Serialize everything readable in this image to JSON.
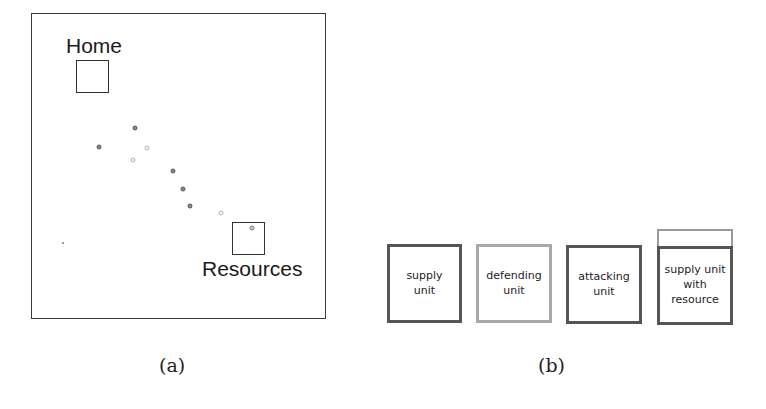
{
  "panel_a": {
    "home_label": "Home",
    "resources_label": "Resources",
    "caption": "(a)",
    "units": [
      {
        "x": 135,
        "y": 128,
        "shade": "dark"
      },
      {
        "x": 99,
        "y": 147,
        "shade": "dark"
      },
      {
        "x": 147,
        "y": 148,
        "shade": "light"
      },
      {
        "x": 133,
        "y": 160,
        "shade": "light"
      },
      {
        "x": 173,
        "y": 171,
        "shade": "dark"
      },
      {
        "x": 183,
        "y": 189,
        "shade": "dark"
      },
      {
        "x": 190,
        "y": 206,
        "shade": "dark"
      },
      {
        "x": 221,
        "y": 213,
        "shade": "light"
      },
      {
        "x": 252,
        "y": 228,
        "shade": "medium"
      }
    ]
  },
  "panel_b": {
    "caption": "(b)",
    "legend": [
      {
        "label_lines": [
          "supply",
          "unit"
        ],
        "border": "dark"
      },
      {
        "label_lines": [
          "defending",
          "unit"
        ],
        "border": "light"
      },
      {
        "label_lines": [
          "attacking",
          "unit"
        ],
        "border": "dark"
      },
      {
        "label_lines": [
          "supply unit",
          "with",
          "resource"
        ],
        "border": "dark",
        "resource_bar": true
      }
    ],
    "labels": {
      "supply": "supply\nunit",
      "defending": "defending\nunit",
      "attacking": "attacking\nunit",
      "supply_with_resource": "supply unit\nwith\nresource"
    }
  },
  "colors": {
    "frame": "#3a3a3a",
    "dark_border": "#555555",
    "light_border": "#a8a8a8",
    "text": "#222222"
  }
}
